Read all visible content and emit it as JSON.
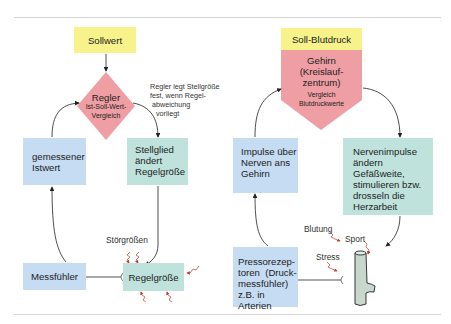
{
  "left_diagram": {
    "sollwert": "Sollwert",
    "regler_title": "Regler",
    "regler_sub1": "Ist-Soll-Wert-",
    "regler_sub2": "Vergleich",
    "regler_note": [
      "Regler legt Stellgröße",
      "fest, wenn Regel-",
      "abweichung",
      "vorliegt"
    ],
    "istwert": [
      "gemessener",
      "Istwert"
    ],
    "stellglied": [
      "Stellglied",
      "ändert",
      "Regelgröße"
    ],
    "stoergroessen": "Störgrößen",
    "messfuehler": "Messfühler",
    "regelgroesse": "Regelgröße"
  },
  "right_diagram": {
    "soll_blutdruck": "Soll-Blutdruck",
    "gehirn": [
      "Gehirn",
      "(Kreislauf-",
      "zentrum)"
    ],
    "vergleich": [
      "Vergleich",
      "Blutdruckwerte"
    ],
    "impulse": [
      "Impulse über",
      "Nerven ans",
      "Gehirn"
    ],
    "nervenimpulse": [
      "Nervenimpulse",
      "ändern",
      "Gefäßweite,",
      "stimulieren bzw.",
      "drosseln die",
      "Herzarbeit"
    ],
    "pressorezeptoren": [
      "Pressorezep-",
      "toren  (Druck-",
      "messfühler)",
      "z.B. in Arterien"
    ],
    "blutdruck": [
      "Blutdruck in",
      "Arteriolen",
      "und anderen",
      "Gefäßen"
    ],
    "disturbances": {
      "blutung": "Blutung",
      "sport": "Sport",
      "stress": "Stress"
    }
  },
  "colors": {
    "setpoint_yellow": "#f7f28a",
    "controller_pink": "#ef9ea4",
    "sensor_blue": "#c6dcf2",
    "actuator_green": "#bfe2dc",
    "disturbance_red": "#c0392b"
  }
}
